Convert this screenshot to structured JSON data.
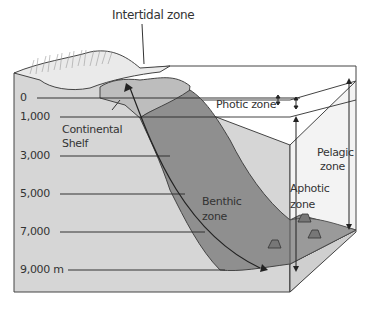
{
  "title_label": "Intertidal zone",
  "depth_scale": {
    "ticks": [
      {
        "label": "0",
        "y": 98
      },
      {
        "label": "1,000",
        "y": 117
      },
      {
        "label": "3,000",
        "y": 156
      },
      {
        "label": "5,000",
        "y": 194
      },
      {
        "label": "7,000",
        "y": 232
      },
      {
        "label": "9,000 m",
        "y": 270
      }
    ]
  },
  "labels": {
    "continental_shelf_line1": "Continental",
    "continental_shelf_line2": "Shelf",
    "photic_zone": "Photic zone",
    "pelagic_line1": "Pelagic",
    "pelagic_line2": "zone",
    "aphotic_line1": "Aphotic",
    "aphotic_line2": "zone",
    "benthic_line1": "Benthic",
    "benthic_line2": "zone"
  },
  "colors": {
    "box_face": "#d9d9d9",
    "water": "#f2f2f2",
    "slope": "#8e8e8e",
    "shelf": "#c8c8c8",
    "land": "#e6e6e6",
    "line": "#333333"
  }
}
